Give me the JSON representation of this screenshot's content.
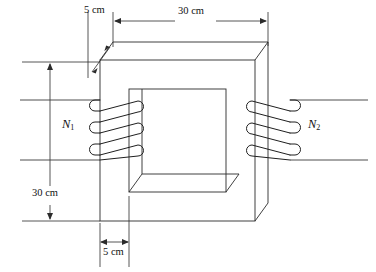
{
  "figure": {
    "kind": "transformer-core-diagram",
    "background_color": "#ffffff",
    "line_color": "#2b2b2b"
  },
  "dimensions": {
    "top_depth": "5 cm",
    "top_width": "30 cm",
    "left_height": "30 cm",
    "bottom_limb_width": "5 cm"
  },
  "windings": {
    "primary_label": "N",
    "primary_sub": "1",
    "secondary_label": "N",
    "secondary_sub": "2",
    "primary_turns": 3,
    "secondary_turns": 3
  },
  "geometry": {
    "core_front": {
      "x": 100,
      "y": 60,
      "w": 155,
      "h": 161
    },
    "core_window": {
      "x": 129,
      "y": 89,
      "w": 97,
      "h": 103
    },
    "depth_dx": 13,
    "depth_dy": -18
  }
}
